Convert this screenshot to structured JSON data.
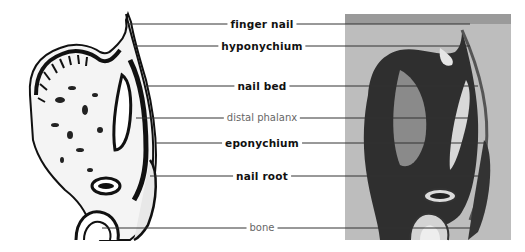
{
  "figure": {
    "left_panel": "line drawing of fingertip longitudinal section",
    "right_panel": "photomicrograph of fingertip longitudinal section",
    "labels": [
      {
        "text": "finger nail",
        "weight": "bold",
        "y": 24
      },
      {
        "text": "hyponychium",
        "weight": "bold",
        "y": 46
      },
      {
        "text": "nail bed",
        "weight": "bold",
        "y": 86
      },
      {
        "text": "distal phalanx",
        "weight": "light",
        "y": 118
      },
      {
        "text": "eponychium",
        "weight": "bold",
        "y": 143
      },
      {
        "text": "nail root",
        "weight": "bold",
        "y": 176
      },
      {
        "text": "bone",
        "weight": "light",
        "y": 228
      }
    ]
  }
}
